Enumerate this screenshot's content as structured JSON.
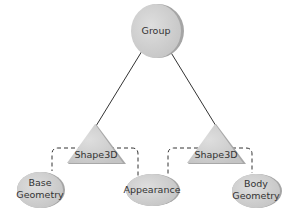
{
  "diagram": {
    "type": "scene-graph",
    "colors": {
      "node_fill": "#cfcfcf",
      "node_rim": "#9a9a9a",
      "edge": "#333333",
      "text": "#333333"
    },
    "nodes": {
      "group": {
        "label": "Group",
        "shape": "circle"
      },
      "shape3d_left": {
        "label": "Shape3D",
        "shape": "triangle"
      },
      "shape3d_right": {
        "label": "Shape3D",
        "shape": "triangle"
      },
      "base_geometry": {
        "label_line1": "Base",
        "label_line2": "Geometry",
        "shape": "ellipse"
      },
      "appearance": {
        "label": "Appearance",
        "shape": "ellipse"
      },
      "body_geometry": {
        "label_line1": "Body",
        "label_line2": "Geometry",
        "shape": "ellipse"
      }
    },
    "edges": [
      {
        "from": "Group",
        "to": "Shape3D (left)",
        "style": "solid"
      },
      {
        "from": "Group",
        "to": "Shape3D (right)",
        "style": "solid"
      },
      {
        "from": "Shape3D (left)",
        "to": "Base Geometry",
        "style": "dashed"
      },
      {
        "from": "Shape3D (left)",
        "to": "Appearance",
        "style": "dashed"
      },
      {
        "from": "Shape3D (right)",
        "to": "Appearance",
        "style": "dashed"
      },
      {
        "from": "Shape3D (right)",
        "to": "Body Geometry",
        "style": "dashed"
      }
    ]
  }
}
